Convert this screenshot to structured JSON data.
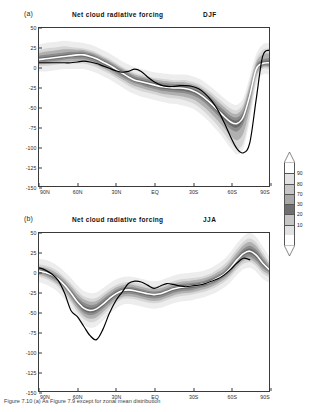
{
  "figure": {
    "caption": "Figure 7.10 (a) As Figure 7.9 except for zonal mean distribution"
  },
  "panels": [
    {
      "key": "a",
      "label": "(a)",
      "title": "Net cloud radiative forcing",
      "season": "DJF",
      "ylabel": "",
      "xlabel": ""
    },
    {
      "key": "b",
      "label": "(b)",
      "title": "Net cloud radiative forcing",
      "season": "JJA",
      "ylabel": "",
      "xlabel": ""
    }
  ],
  "axis": {
    "yticks": [
      50,
      25,
      0,
      -25,
      -50,
      -75,
      -100,
      -125,
      -150
    ],
    "ytick_labels": [
      "50",
      "25",
      "0",
      "-25",
      "-50",
      "-75",
      "-100",
      "-125",
      "-150"
    ],
    "ylim": [
      -150,
      50
    ],
    "xtick_labels": [
      "90N",
      "60N",
      "30N",
      "EQ",
      "30S",
      "60S",
      "90S"
    ],
    "xticks": [
      90,
      60,
      30,
      0,
      -30,
      -60,
      -90
    ],
    "xlim": [
      90,
      -90
    ]
  },
  "colorbar": {
    "name": "percentile-colorbar",
    "orientation": "vertical",
    "labels": [
      "90",
      "80",
      "70",
      "30",
      "20",
      "10"
    ],
    "levels": [
      10,
      20,
      30,
      70,
      80,
      90
    ],
    "colors": [
      "#ffffff",
      "#e2e2e2",
      "#c6c6c6",
      "#a8a8a8",
      "#6f6f6f",
      "#c6c6c6",
      "#e2e2e2",
      "#ffffff"
    ],
    "has_top_arrow": true,
    "has_bottom_arrow": true
  },
  "style": {
    "median_line_color": "#ffffff",
    "observation_line_color": "#000000",
    "band_outer": "#d6d6d6",
    "band_mid": "#b0b0b0",
    "band_inner": "#8c8c8c",
    "band_core": "#6b6b6b",
    "frame_color": "#3a3a3a"
  },
  "chart_data": {
    "type": "line",
    "title": "Net cloud radiative forcing",
    "xlabel": "Latitude",
    "ylabel": "W m-2",
    "xlim": [
      90,
      -90
    ],
    "ylim": [
      -150,
      50
    ],
    "grid": false,
    "legend": "none",
    "x": [
      90,
      85,
      80,
      75,
      70,
      65,
      60,
      55,
      50,
      45,
      40,
      35,
      30,
      25,
      20,
      15,
      10,
      5,
      0,
      -5,
      -10,
      -15,
      -20,
      -25,
      -30,
      -35,
      -40,
      -45,
      -50,
      -55,
      -60,
      -65,
      -70,
      -75,
      -80,
      -85,
      -90
    ],
    "panels": [
      {
        "key": "a",
        "season": "DJF",
        "series": [
          {
            "name": "model median",
            "style": "white-line",
            "values": [
              10,
              11,
              12,
              13,
              14,
              15,
              16,
              16,
              14,
              11,
              7,
              3,
              -2,
              -7,
              -12,
              -16,
              -18,
              -20,
              -22,
              -24,
              -25,
              -26,
              -26,
              -27,
              -29,
              -33,
              -39,
              -46,
              -54,
              -62,
              -69,
              -71,
              -62,
              -35,
              -2,
              5,
              6
            ]
          },
          {
            "name": "observations",
            "style": "black-line",
            "values": [
              6,
              6,
              6,
              6,
              6,
              6,
              7,
              8,
              7,
              5,
              2,
              -1,
              -4,
              -6,
              -5,
              -2,
              -5,
              -12,
              -18,
              -22,
              -24,
              -24,
              -23,
              -23,
              -24,
              -27,
              -33,
              -42,
              -54,
              -70,
              -88,
              -103,
              -108,
              -95,
              -40,
              14,
              22
            ]
          },
          {
            "name": "spread band outer (10-90%)",
            "style": "shaded",
            "upper": [
              22,
              24,
              25,
              26,
              27,
              26,
              25,
              24,
              22,
              19,
              15,
              11,
              6,
              1,
              -3,
              -7,
              -9,
              -11,
              -13,
              -14,
              -15,
              -16,
              -16,
              -16,
              -18,
              -21,
              -26,
              -32,
              -39,
              -46,
              -52,
              -54,
              -45,
              -18,
              10,
              22,
              24
            ],
            "lower": [
              2,
              2,
              3,
              4,
              5,
              5,
              5,
              5,
              3,
              0,
              -4,
              -8,
              -13,
              -18,
              -23,
              -27,
              -30,
              -32,
              -34,
              -36,
              -38,
              -39,
              -40,
              -42,
              -45,
              -50,
              -57,
              -65,
              -74,
              -84,
              -95,
              -103,
              -95,
              -60,
              -16,
              -2,
              -2
            ]
          },
          {
            "name": "spread band inner (30-70%)",
            "style": "shaded",
            "upper": [
              15,
              16,
              17,
              18,
              19,
              20,
              20,
              20,
              18,
              15,
              11,
              7,
              2,
              -3,
              -7,
              -11,
              -13,
              -15,
              -17,
              -19,
              -20,
              -21,
              -21,
              -22,
              -24,
              -27,
              -33,
              -39,
              -47,
              -54,
              -61,
              -63,
              -54,
              -27,
              3,
              10,
              12
            ],
            "lower": [
              6,
              7,
              8,
              9,
              10,
              11,
              11,
              11,
              9,
              6,
              2,
              -2,
              -7,
              -12,
              -16,
              -20,
              -22,
              -25,
              -27,
              -29,
              -30,
              -31,
              -32,
              -33,
              -35,
              -39,
              -45,
              -53,
              -61,
              -70,
              -78,
              -81,
              -71,
              -43,
              -7,
              2,
              2
            ]
          }
        ]
      },
      {
        "key": "b",
        "season": "JJA",
        "series": [
          {
            "name": "model median",
            "style": "white-line",
            "values": [
              2,
              0,
              -3,
              -8,
              -16,
              -26,
              -37,
              -45,
              -48,
              -46,
              -40,
              -33,
              -27,
              -23,
              -22,
              -23,
              -25,
              -27,
              -28,
              -27,
              -24,
              -21,
              -19,
              -18,
              -17,
              -16,
              -14,
              -11,
              -7,
              -2,
              6,
              16,
              24,
              27,
              22,
              12,
              4
            ]
          },
          {
            "name": "observations",
            "style": "black-line",
            "values": [
              6,
              3,
              -2,
              -10,
              -26,
              -48,
              -56,
              -68,
              -80,
              -85,
              -72,
              -52,
              -36,
              -25,
              -14,
              -11,
              -12,
              -16,
              -20,
              -17,
              -14,
              -15,
              -17,
              -18,
              -17,
              -16,
              -14,
              -11,
              -8,
              -3,
              4,
              12,
              18,
              16,
              null,
              null,
              null
            ]
          },
          {
            "name": "spread band outer (10-90%)",
            "style": "shaded",
            "upper": [
              10,
              9,
              6,
              1,
              -6,
              -14,
              -23,
              -30,
              -33,
              -32,
              -27,
              -21,
              -16,
              -13,
              -12,
              -13,
              -15,
              -17,
              -18,
              -17,
              -14,
              -11,
              -9,
              -8,
              -7,
              -6,
              -4,
              -1,
              4,
              10,
              19,
              30,
              39,
              43,
              38,
              26,
              14
            ],
            "lower": [
              -5,
              -8,
              -12,
              -18,
              -27,
              -38,
              -50,
              -59,
              -63,
              -61,
              -54,
              -46,
              -39,
              -34,
              -33,
              -34,
              -36,
              -38,
              -39,
              -38,
              -35,
              -32,
              -30,
              -29,
              -28,
              -26,
              -24,
              -21,
              -17,
              -12,
              -5,
              4,
              11,
              13,
              8,
              -1,
              -6
            ]
          },
          {
            "name": "spread band inner (30-70%)",
            "style": "shaded",
            "upper": [
              5,
              3,
              0,
              -5,
              -12,
              -21,
              -31,
              -38,
              -41,
              -40,
              -34,
              -28,
              -22,
              -19,
              -18,
              -19,
              -21,
              -23,
              -24,
              -23,
              -20,
              -17,
              -15,
              -14,
              -13,
              -12,
              -10,
              -7,
              -3,
              2,
              11,
              21,
              30,
              34,
              29,
              18,
              8
            ],
            "lower": [
              -1,
              -3,
              -7,
              -12,
              -20,
              -31,
              -42,
              -51,
              -54,
              -52,
              -46,
              -39,
              -32,
              -28,
              -27,
              -28,
              -30,
              -32,
              -33,
              -32,
              -29,
              -26,
              -24,
              -23,
              -22,
              -20,
              -18,
              -15,
              -11,
              -6,
              1,
              11,
              18,
              20,
              15,
              6,
              0
            ]
          }
        ]
      }
    ]
  }
}
